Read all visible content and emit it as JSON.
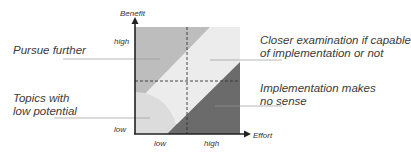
{
  "diagram": {
    "axes": {
      "y_label": "Benefit",
      "x_label": "Effort",
      "y_ticks": [
        "high",
        "low"
      ],
      "x_ticks": [
        "low",
        "high"
      ]
    },
    "regions": [
      {
        "id": "pursue",
        "label_lines": [
          "Pursue further"
        ],
        "color": "#bdbdbd"
      },
      {
        "id": "closer",
        "label_lines": [
          "Closer examination if capable",
          "of implementation or not"
        ],
        "color": "#ececec"
      },
      {
        "id": "no-sense",
        "label_lines": [
          "Implementation makes",
          "no sense"
        ],
        "color": "#6b6b6b"
      },
      {
        "id": "low-potential",
        "label_lines": [
          "Topics with",
          "low potential"
        ],
        "color": "#dcdcdc"
      }
    ]
  }
}
